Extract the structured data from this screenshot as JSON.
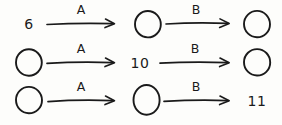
{
  "diagram": {
    "kind": "hand-drawn-sketch",
    "ink_color": "#1a1a1a",
    "background_color": "#fdfdfb",
    "blank_node_glyph": "circle",
    "rows": [
      {
        "row_id": "row-1",
        "nodes": [
          {
            "id": "r1n1",
            "kind": "value",
            "text": "6"
          },
          {
            "id": "r1n2",
            "kind": "blank",
            "text": ""
          },
          {
            "id": "r1n3",
            "kind": "blank",
            "text": ""
          }
        ],
        "arrows": [
          {
            "id": "r1a1",
            "label": "A",
            "from": "r1n1",
            "to": "r1n2"
          },
          {
            "id": "r1a2",
            "label": "B",
            "from": "r1n2",
            "to": "r1n3"
          }
        ]
      },
      {
        "row_id": "row-2",
        "nodes": [
          {
            "id": "r2n1",
            "kind": "blank",
            "text": ""
          },
          {
            "id": "r2n2",
            "kind": "value",
            "text": "10"
          },
          {
            "id": "r2n3",
            "kind": "blank",
            "text": ""
          }
        ],
        "arrows": [
          {
            "id": "r2a1",
            "label": "A",
            "from": "r2n1",
            "to": "r2n2"
          },
          {
            "id": "r2a2",
            "label": "B",
            "from": "r2n2",
            "to": "r2n3"
          }
        ]
      },
      {
        "row_id": "row-3",
        "nodes": [
          {
            "id": "r3n1",
            "kind": "blank",
            "text": ""
          },
          {
            "id": "r3n2",
            "kind": "blank",
            "text": ""
          },
          {
            "id": "r3n3",
            "kind": "value",
            "text": "11"
          }
        ],
        "arrows": [
          {
            "id": "r3a1",
            "label": "A",
            "from": "r3n1",
            "to": "r3n2"
          },
          {
            "id": "r3a2",
            "label": "B",
            "from": "r3n2",
            "to": "r3n3"
          }
        ]
      }
    ]
  }
}
